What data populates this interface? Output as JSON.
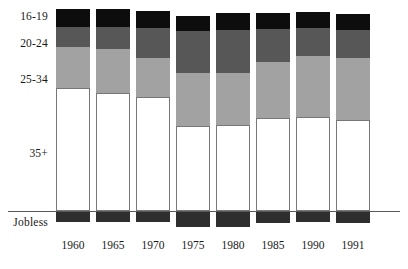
{
  "chart_data": {
    "type": "bar",
    "title": "",
    "subtitle": "",
    "xlabel": "",
    "ylabel": "",
    "stacked": true,
    "grid": false,
    "legend_position": "left-inline",
    "categories": [
      "1960",
      "1965",
      "1970",
      "1975",
      "1980",
      "1985",
      "1990",
      "1991"
    ],
    "series": [
      {
        "name": "16-19",
        "color": "#0d0d0d",
        "values": [
          8.9,
          8.9,
          8.4,
          7.4,
          8.4,
          7.9,
          7.9,
          7.9
        ]
      },
      {
        "name": "20-24",
        "color": "#575757",
        "values": [
          9.9,
          10.9,
          14.9,
          20.8,
          21.3,
          16.3,
          13.9,
          13.9
        ]
      },
      {
        "name": "25-34",
        "color": "#a2a2a2",
        "values": [
          20.3,
          21.8,
          19.3,
          26.2,
          25.7,
          27.7,
          30.2,
          30.7
        ]
      },
      {
        "name": "35+",
        "color": "#ffffff",
        "values": [
          60.9,
          58.4,
          56.4,
          42.1,
          42.6,
          46.0,
          46.5,
          45.3
        ]
      },
      {
        "name": "Jobless",
        "color": "#2e2e2e",
        "values": [
          5.5,
          5.5,
          5.5,
          7.9,
          7.9,
          6.0,
          5.5,
          6.0
        ]
      }
    ],
    "category_labels": [
      "16-19",
      "20-24",
      "25-34",
      "35+",
      "Jobless"
    ],
    "baseline_label": "Jobless"
  },
  "axis": {
    "years": [
      "1960",
      "1965",
      "1970",
      "1975",
      "1980",
      "1985",
      "1990",
      "1991"
    ]
  },
  "legend": {
    "items": [
      "16-19",
      "20-24",
      "25-34",
      "35+",
      "Jobless"
    ]
  },
  "geometry": {
    "baseline_y": 211,
    "bar_width": 34,
    "bars": [
      {
        "year": "1960",
        "x": 56,
        "top": 9,
        "y_16_19": 27,
        "y_20_24": 47,
        "y_25_34": 88,
        "jobless_bottom": 222
      },
      {
        "year": "1965",
        "x": 96,
        "top": 9,
        "y_16_19": 27,
        "y_20_24": 49,
        "y_25_34": 93,
        "jobless_bottom": 222
      },
      {
        "year": "1970",
        "x": 136,
        "top": 11,
        "y_16_19": 28,
        "y_20_24": 58,
        "y_25_34": 97,
        "jobless_bottom": 222
      },
      {
        "year": "1975",
        "x": 176,
        "top": 16,
        "y_16_19": 31,
        "y_20_24": 73,
        "y_25_34": 126,
        "jobless_bottom": 227
      },
      {
        "year": "1980",
        "x": 216,
        "top": 13,
        "y_16_19": 30,
        "y_20_24": 73,
        "y_25_34": 125,
        "jobless_bottom": 227
      },
      {
        "year": "1985",
        "x": 256,
        "top": 13,
        "y_16_19": 29,
        "y_20_24": 62,
        "y_25_34": 118,
        "jobless_bottom": 223
      },
      {
        "year": "1990",
        "x": 296,
        "top": 12,
        "y_16_19": 28,
        "y_20_24": 56,
        "y_25_34": 117,
        "jobless_bottom": 222
      },
      {
        "year": "1991",
        "x": 336,
        "top": 14,
        "y_16_19": 30,
        "y_20_24": 58,
        "y_25_34": 120,
        "jobless_bottom": 223
      }
    ],
    "category_label_y": [
      11,
      38,
      74,
      148,
      217
    ],
    "year_label_y": 240
  },
  "colors": {
    "age_16_19": "#0d0d0d",
    "age_20_24": "#575757",
    "age_25_34": "#a2a2a2",
    "age_35plus": "#ffffff",
    "jobless": "#2e2e2e",
    "axis": "#5a5a5a",
    "text": "#1a1a1a",
    "background": "#ffffff"
  }
}
